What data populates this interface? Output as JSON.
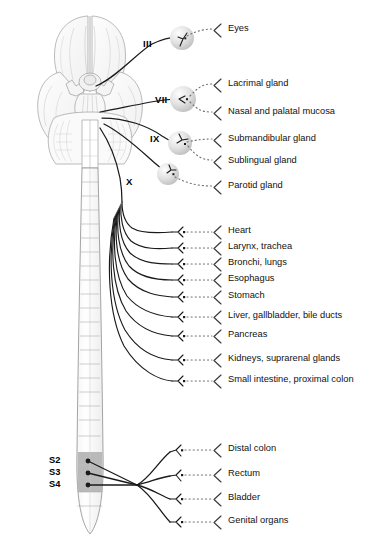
{
  "diagram": {
    "colors": {
      "stroke": "#1a1a1a",
      "dotted": "#6e6e6e",
      "brain_fill": "#fbfbfb",
      "brain_line": "#9a9a9a",
      "cord_fill": "#ffffff",
      "cord_line": "#8d8d8d",
      "segment_shade": "#b9b9b9",
      "ganglion": "#dcdcdc",
      "text": "#111111"
    }
  },
  "cranial_nerves": [
    {
      "numeral": "III",
      "x": 143,
      "y": 43
    },
    {
      "numeral": "VII",
      "x": 155,
      "y": 99
    },
    {
      "numeral": "IX",
      "x": 150,
      "y": 138
    },
    {
      "numeral": "X",
      "x": 126,
      "y": 181
    }
  ],
  "spinal_segments": [
    {
      "label": "S2",
      "x": 49,
      "y": 460
    },
    {
      "label": "S3",
      "x": 49,
      "y": 472
    },
    {
      "label": "S4",
      "x": 49,
      "y": 484
    }
  ],
  "targets": {
    "cranial": [
      {
        "label": "Eyes",
        "text_x": 228,
        "text_y": 28,
        "gx": 182,
        "gy": 38,
        "bracket_x": 216,
        "bracket_y": 31
      },
      {
        "label": "Lacrimal gland",
        "text_x": 228,
        "text_y": 82,
        "gx": 183,
        "gy": 99,
        "bracket_x": 216,
        "bracket_y": 85
      },
      {
        "label": "Nasal and palatal mucosa",
        "text_x": 228,
        "text_y": 110,
        "gx": 183,
        "gy": 99,
        "bracket_x": 216,
        "bracket_y": 113
      },
      {
        "label": "Submandibular gland",
        "text_x": 228,
        "text_y": 137,
        "gx": 180,
        "gy": 143,
        "bracket_x": 216,
        "bracket_y": 140
      },
      {
        "label": "Sublingual gland",
        "text_x": 228,
        "text_y": 159,
        "gx": 180,
        "gy": 143,
        "bracket_x": 216,
        "bracket_y": 162
      },
      {
        "label": "Parotid gland",
        "text_x": 228,
        "text_y": 184,
        "gx": 168,
        "gy": 174,
        "bracket_x": 216,
        "bracket_y": 187
      }
    ],
    "vagal": [
      {
        "label": "Heart",
        "text_x": 228,
        "text_y": 229,
        "gy": 232
      },
      {
        "label": "Larynx, trachea",
        "text_x": 228,
        "text_y": 245,
        "gy": 248
      },
      {
        "label": "Bronchi, lungs",
        "text_x": 228,
        "text_y": 261,
        "gy": 264
      },
      {
        "label": "Esophagus",
        "text_x": 228,
        "text_y": 277,
        "gy": 280
      },
      {
        "label": "Stomach",
        "text_x": 228,
        "text_y": 294,
        "gy": 297
      },
      {
        "label": "Liver, gallbladder, bile ducts",
        "text_x": 228,
        "text_y": 314,
        "gy": 317
      },
      {
        "label": "Pancreas",
        "text_x": 228,
        "text_y": 333,
        "gy": 336
      },
      {
        "label": "Kidneys, suprarenal glands",
        "text_x": 228,
        "text_y": 357,
        "gy": 360
      },
      {
        "label": "Small intestine, proximal colon",
        "text_x": 228,
        "text_y": 378,
        "gy": 381
      }
    ],
    "sacral": [
      {
        "label": "Distal colon",
        "text_x": 228,
        "text_y": 447,
        "gy": 450
      },
      {
        "label": "Rectum",
        "text_x": 228,
        "text_y": 472,
        "gy": 475
      },
      {
        "label": "Bladder",
        "text_x": 228,
        "text_y": 495,
        "gy": 498
      },
      {
        "label": "Genital organs",
        "text_x": 228,
        "text_y": 519,
        "gy": 522
      }
    ]
  }
}
